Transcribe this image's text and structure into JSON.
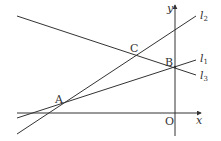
{
  "diagram": {
    "type": "coordinate-geometry",
    "axes": {
      "x_label": "x",
      "y_label": "y",
      "origin_label": "O"
    },
    "lines": [
      {
        "name": "l",
        "subscript": "2",
        "id": "l2",
        "passes_through": [
          "A",
          "C"
        ]
      },
      {
        "name": "l",
        "subscript": "1",
        "id": "l1",
        "passes_through": [
          "A",
          "B"
        ]
      },
      {
        "name": "l",
        "subscript": "3",
        "id": "l3",
        "passes_through": [
          "C",
          "B"
        ]
      }
    ],
    "points": [
      {
        "label": "A",
        "description": "intersection of l1 and l2"
      },
      {
        "label": "B",
        "description": "intersection of l1 and l3, on the y-axis"
      },
      {
        "label": "C",
        "description": "intersection of l2 and l3"
      }
    ],
    "colors": {
      "line": "#333333",
      "background": "#ffffff"
    }
  }
}
